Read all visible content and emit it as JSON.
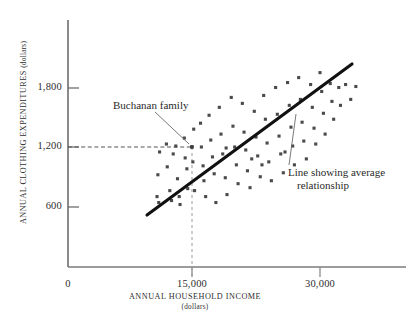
{
  "chart_data": {
    "type": "scatter",
    "title": "",
    "xlabel": "ANNUAL HOUSEHOLD INCOME",
    "xlabel_sub": "(dollars)",
    "ylabel": "ANNUAL CLOTHING EXPENDITURES",
    "ylabel_sub": "(dollars)",
    "xlim": [
      0,
      37000
    ],
    "ylim": [
      0,
      2150
    ],
    "grid": false,
    "legend": null,
    "xticks": [
      {
        "value": 0,
        "label": "0"
      },
      {
        "value": 15000,
        "label": "15,000"
      },
      {
        "value": 30000,
        "label": "30,000"
      }
    ],
    "yticks": [
      {
        "value": 600,
        "label": "600"
      },
      {
        "value": 1200,
        "label": "1,200"
      },
      {
        "value": 1800,
        "label": "1,800"
      }
    ],
    "point_color": "#4a4a4a",
    "line_color": "#111111",
    "points": [
      [
        11200,
        1150
      ],
      [
        11000,
        920
      ],
      [
        10900,
        700
      ],
      [
        11100,
        640
      ],
      [
        12000,
        1230
      ],
      [
        12100,
        1000
      ],
      [
        12400,
        760
      ],
      [
        12600,
        660
      ],
      [
        13100,
        1210
      ],
      [
        13300,
        880
      ],
      [
        13500,
        700
      ],
      [
        13600,
        620
      ],
      [
        14100,
        1290
      ],
      [
        14200,
        1090
      ],
      [
        14400,
        980
      ],
      [
        14500,
        780
      ],
      [
        15000,
        1200
      ],
      [
        15100,
        1050
      ],
      [
        15200,
        1380
      ],
      [
        15300,
        760
      ],
      [
        16000,
        1440
      ],
      [
        16100,
        1200
      ],
      [
        16300,
        1010
      ],
      [
        16400,
        860
      ],
      [
        16600,
        700
      ],
      [
        17000,
        1520
      ],
      [
        17200,
        1270
      ],
      [
        17400,
        1100
      ],
      [
        17600,
        930
      ],
      [
        17800,
        640
      ],
      [
        18200,
        1600
      ],
      [
        18400,
        1330
      ],
      [
        18600,
        1130
      ],
      [
        18900,
        890
      ],
      [
        19100,
        720
      ],
      [
        19600,
        1700
      ],
      [
        19800,
        1410
      ],
      [
        20000,
        1200
      ],
      [
        20200,
        1020
      ],
      [
        20400,
        830
      ],
      [
        20900,
        1640
      ],
      [
        21100,
        1350
      ],
      [
        21300,
        1170
      ],
      [
        21500,
        960
      ],
      [
        21800,
        790
      ],
      [
        22300,
        1560
      ],
      [
        22500,
        1300
      ],
      [
        22700,
        1110
      ],
      [
        23000,
        900
      ],
      [
        23400,
        1720
      ],
      [
        23600,
        1480
      ],
      [
        23800,
        1240
      ],
      [
        24000,
        1050
      ],
      [
        24300,
        860
      ],
      [
        24800,
        1800
      ],
      [
        25000,
        1530
      ],
      [
        25200,
        1310
      ],
      [
        25400,
        1130
      ],
      [
        25700,
        940
      ],
      [
        26200,
        1850
      ],
      [
        26400,
        1620
      ],
      [
        26600,
        1400
      ],
      [
        26800,
        1210
      ],
      [
        27000,
        1020
      ],
      [
        27500,
        1900
      ],
      [
        27700,
        1680
      ],
      [
        27900,
        1450
      ],
      [
        28100,
        1260
      ],
      [
        28400,
        1080
      ],
      [
        28900,
        1830
      ],
      [
        29100,
        1600
      ],
      [
        29300,
        1390
      ],
      [
        29500,
        1230
      ],
      [
        30000,
        1950
      ],
      [
        30200,
        1760
      ],
      [
        30400,
        1540
      ],
      [
        30600,
        1330
      ],
      [
        31200,
        1840
      ],
      [
        31400,
        1660
      ],
      [
        31600,
        1480
      ],
      [
        32200,
        1800
      ],
      [
        32400,
        1620
      ],
      [
        33000,
        1830
      ],
      [
        33600,
        1680
      ],
      [
        34200,
        1810
      ],
      [
        12800,
        1130
      ],
      [
        19000,
        1190
      ],
      [
        23200,
        1020
      ],
      [
        25900,
        1150
      ],
      [
        22000,
        1080
      ]
    ],
    "highlighted_point": {
      "name": "Buchanan family",
      "x": 15000,
      "y": 1200,
      "guide_lines": "dashed"
    },
    "trend_line": {
      "name": "Line showing average relationship",
      "x_start": 10000,
      "y_start": 540,
      "x_end": 33700,
      "y_end": 2060
    }
  },
  "annotations": {
    "buchanan_label": "Buchanan family",
    "trendline_label_line1": "Line showing average",
    "trendline_label_line2": "relationship"
  }
}
